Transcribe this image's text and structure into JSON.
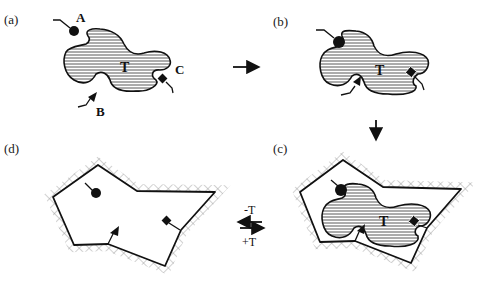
{
  "diagram": {
    "type": "molecular-imprinting-schematic",
    "panels": [
      {
        "id": "a",
        "label": "(a)",
        "description": "Template T with free functional monomers A, B, C"
      },
      {
        "id": "b",
        "label": "(b)",
        "description": "Monomers A, B, C bound to template T"
      },
      {
        "id": "c",
        "label": "(c)",
        "description": "Template-monomer complex embedded in cross-linked polymer matrix"
      },
      {
        "id": "d",
        "label": "(d)",
        "description": "Imprinted cavity after template removal"
      }
    ],
    "template_label": "T",
    "monomers": [
      {
        "label": "A",
        "shape": "circle"
      },
      {
        "label": "B",
        "shape": "triangle"
      },
      {
        "label": "C",
        "shape": "square"
      }
    ],
    "equilibrium": {
      "top_label": "-T",
      "bottom_label": "+T"
    },
    "colors": {
      "ink": "#111111",
      "background": "#ffffff",
      "hatch": "#9a9a9a"
    }
  }
}
